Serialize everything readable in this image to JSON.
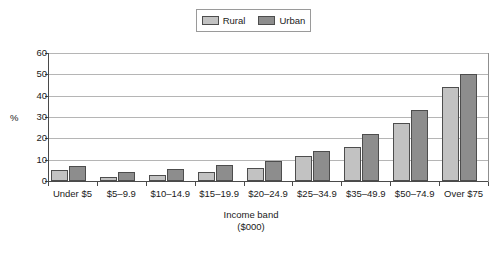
{
  "chart_data": {
    "type": "bar",
    "title": "",
    "xlabel": "Income band ($000)",
    "ylabel": "%",
    "categories": [
      "Under $5",
      "$5–9.9",
      "$10–14.9",
      "$15–19.9",
      "$20–24.9",
      "$25–34.9",
      "$35–49.9",
      "$50–74.9",
      "Over $75"
    ],
    "series": [
      {
        "name": "Rural",
        "color": "#c2c2c2",
        "values": [
          5,
          2,
          3,
          4,
          6,
          11.5,
          16,
          27,
          44
        ]
      },
      {
        "name": "Urban",
        "color": "#8d8d8d",
        "values": [
          7,
          4,
          5.5,
          7.5,
          9.5,
          14,
          22,
          33.5,
          50
        ]
      }
    ],
    "ylim": [
      0,
      60
    ],
    "yticks": [
      0,
      10,
      20,
      30,
      40,
      50,
      60
    ],
    "ytick_labels": [
      "0",
      "10",
      "20",
      "30",
      "40",
      "50",
      "60"
    ],
    "grid": "horizontal",
    "legend_position": "top-center"
  },
  "axis": {
    "y_title": "%",
    "x_title_line1": "Income band",
    "x_title_line2": "($000)"
  },
  "legend": {
    "items": [
      {
        "label": "Rural"
      },
      {
        "label": "Urban"
      }
    ]
  }
}
